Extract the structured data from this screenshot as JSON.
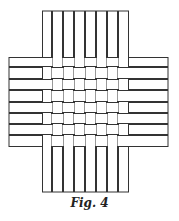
{
  "figure": {
    "caption": "Fig. 4",
    "stroke_color": "#333333",
    "fill_color": "#ffffff",
    "vertical_strips": {
      "count": 8,
      "x_edges": [
        42,
        52,
        63,
        74,
        85,
        96,
        107,
        118,
        129
      ],
      "top": 11,
      "bottom": 192
    },
    "horizontal_strips": {
      "count": 8,
      "y_edges": [
        57,
        67,
        79,
        90,
        102,
        113,
        124,
        135,
        147
      ],
      "left": 9,
      "right": 168
    },
    "weave_pattern": "alternating over-under (checkerboard)"
  }
}
